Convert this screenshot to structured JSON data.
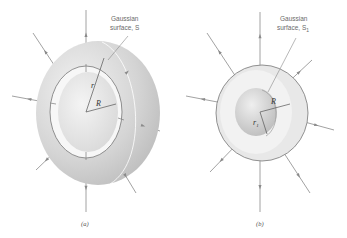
{
  "figure": {
    "panels": [
      {
        "id": "a",
        "caption": "(a)",
        "surface_label_line1": "Gaussian",
        "surface_label_line2": "surface, S",
        "radius_labels": {
          "gaussian": "r",
          "sphere": "R"
        }
      },
      {
        "id": "b",
        "caption": "(b)",
        "surface_label_line1": "Gaussian",
        "surface_label_line2": "surface, S",
        "surface_label_subscript": "1",
        "radius_labels": {
          "gaussian": "r",
          "gaussian_subscript": "1",
          "sphere": "R"
        }
      }
    ],
    "colors": {
      "shell_outer": "#d6d6d6",
      "shell_inner": "#ececec",
      "field_line": "#8a8a8a",
      "text": "#6a6a6a"
    }
  }
}
